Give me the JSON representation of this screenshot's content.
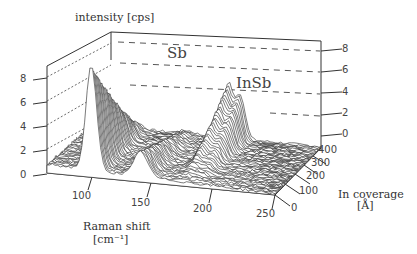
{
  "chart_data": {
    "type": "waterfall-3d",
    "title": "",
    "zlabel": "intensity [cps]",
    "xlabel": "Raman shift",
    "xlabel_unit": "[cm⁻¹]",
    "ylabel": "In coverage",
    "ylabel_unit": "[Å]",
    "z_ticks_left": [
      "0",
      "2",
      "4",
      "6",
      "8"
    ],
    "z_ticks_right": [
      "0",
      "2",
      "4",
      "6",
      "8"
    ],
    "x_ticks": [
      "100",
      "150",
      "200",
      "250"
    ],
    "y_ticks": [
      "0",
      "100",
      "200",
      "300",
      "400"
    ],
    "xlim": [
      80,
      250
    ],
    "ylim": [
      0,
      450
    ],
    "zlim": [
      0,
      9
    ],
    "annotations": [
      {
        "text": "Sb",
        "near_x": 115,
        "note": "dominant peak at low coverage"
      },
      {
        "text": "InSb",
        "near_x": 185,
        "note": "peaks emerging at higher coverage"
      }
    ],
    "series_description": "Stacked Raman spectra vs In coverage; Sb peak ~113 cm-1 reaching ~9 cps at 0 coverage, decreasing with coverage; Sb secondary ~150 cm-1; InSb TO/LO peaks ~180/190 cm-1 growing to ~5 cps",
    "peaks": [
      {
        "label": "Sb A1g",
        "x": 113,
        "max_intensity": 9.0
      },
      {
        "label": "Sb Eg",
        "x": 150,
        "max_intensity": 2.0
      },
      {
        "label": "InSb TO",
        "x": 180,
        "max_intensity": 5.0
      },
      {
        "label": "InSb LO",
        "x": 190,
        "max_intensity": 4.0
      }
    ],
    "grid": "dashed lines on back wall at 2,4,6,8",
    "n_spectra": 40
  },
  "labels": {
    "intensity": "intensity [cps]",
    "raman": "Raman shift",
    "raman_unit": "[cm⁻¹]",
    "coverage": "In coverage",
    "coverage_unit": "[Å]",
    "sb": "Sb",
    "insb": "InSb"
  },
  "ticks": {
    "left": [
      "8",
      "6",
      "4",
      "2",
      "0"
    ],
    "right": [
      "8",
      "6",
      "4",
      "2",
      "0"
    ],
    "x": [
      "100",
      "150",
      "200",
      "250"
    ],
    "y": [
      "400",
      "300",
      "200",
      "100",
      "0"
    ]
  }
}
